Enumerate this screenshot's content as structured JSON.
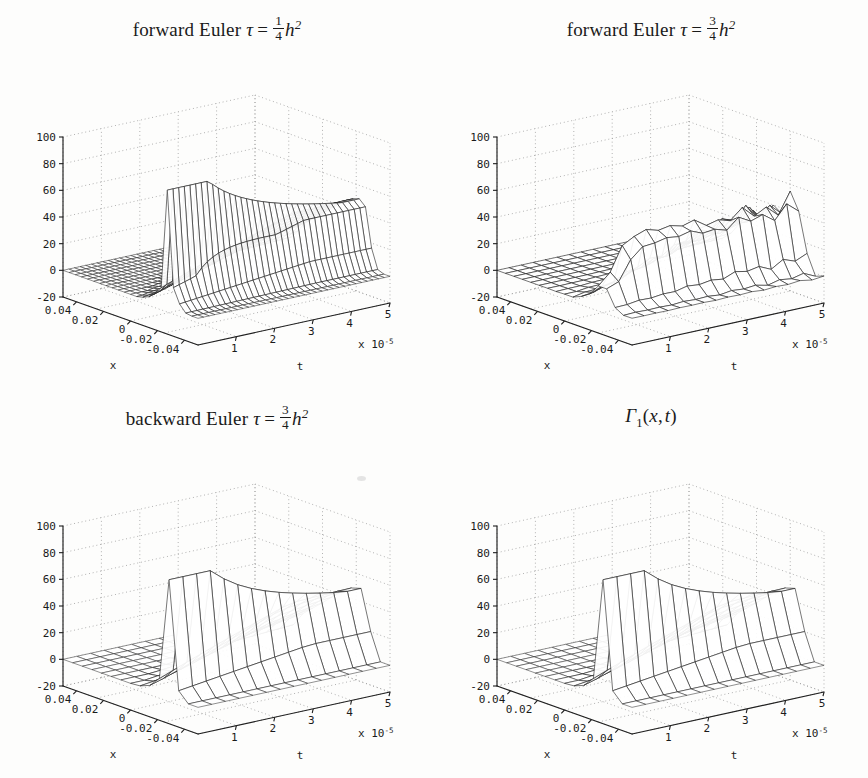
{
  "figure": {
    "background_color": "#fdfdfc",
    "ink_color": "#1a1a1a",
    "grid_color": "#9b9b9b",
    "layout": "2x2",
    "width": 868,
    "height": 778
  },
  "panels": [
    {
      "id": "forward-euler-quarter",
      "title_text": "forward Euler τ = 1/4 h²",
      "title_parts": {
        "scheme": "forward Euler",
        "tau": "τ",
        "equals": "=",
        "frac_num": "1",
        "frac_den": "4",
        "base": "h",
        "exponent": "2"
      },
      "behaviour": "stable smooth decaying pulse, fine mesh"
    },
    {
      "id": "forward-euler-three-quarter",
      "title_text": "forward Euler τ = 3/4 h²",
      "title_parts": {
        "scheme": "forward Euler",
        "tau": "τ",
        "equals": "=",
        "frac_num": "3",
        "frac_den": "4",
        "base": "h",
        "exponent": "2"
      },
      "behaviour": "unstable, growing sawtooth oscillations in t"
    },
    {
      "id": "backward-euler-three-quarter",
      "title_text": "backward Euler τ = 3/4 h²",
      "title_parts": {
        "scheme": "backward Euler",
        "tau": "τ",
        "equals": "=",
        "frac_num": "3",
        "frac_den": "4",
        "base": "h",
        "exponent": "2"
      },
      "behaviour": "stable smooth decaying pulse, coarse mesh"
    },
    {
      "id": "exact-kernel",
      "title_text": "Γ1(x,t)",
      "title_parts": {
        "symbol": "Γ",
        "subscript": "1",
        "args": "(x, t)"
      },
      "behaviour": "exact heat kernel reference surface, coarse mesh"
    }
  ],
  "axes": {
    "z": {
      "label": "",
      "ticks": [
        100,
        80,
        60,
        40,
        20,
        0,
        -20
      ],
      "tick_labels": [
        "100",
        "80",
        "60",
        "40",
        "20",
        "0",
        "-20"
      ],
      "limits": [
        -20,
        100
      ]
    },
    "x": {
      "label": "x",
      "ticks": [
        0.04,
        0.02,
        0,
        -0.02,
        -0.04
      ],
      "tick_labels": [
        "0.04",
        "0.02",
        "0",
        "-0.02",
        "-0.04"
      ],
      "limits": [
        -0.05,
        0.05
      ]
    },
    "t": {
      "label": "t",
      "ticks": [
        1,
        2,
        3,
        4,
        5
      ],
      "tick_labels": [
        "1",
        "2",
        "3",
        "4",
        "5"
      ],
      "limits": [
        0,
        5
      ],
      "multiplier_text": "x 10",
      "multiplier_exponent": "-5"
    }
  },
  "chart_data": {
    "type": "surface",
    "xlabel": "x",
    "ylabel": "t",
    "zlabel": "u",
    "xlim": [
      -0.05,
      0.05
    ],
    "ylim": [
      0,
      5e-05
    ],
    "zlim": [
      -20,
      100
    ],
    "xticks": [
      0.04,
      0.02,
      0,
      -0.02,
      -0.04
    ],
    "yticks": [
      1e-05,
      2e-05,
      3e-05,
      4e-05,
      5e-05
    ],
    "zticks": [
      -20,
      0,
      20,
      40,
      60,
      80,
      100
    ],
    "grid": true,
    "legend": "none",
    "view": "azimuth -37.5, elevation 30 (MATLAB default)",
    "peak_value": 88,
    "plateau_value": 50,
    "surfaces": [
      {
        "name": "forward Euler tau = h^2/4",
        "stable": true,
        "mesh_t_lines": 34,
        "mesh_x_lines": 22,
        "peak_z": 88,
        "plateau_z": 50,
        "note": "monotone decay in x, no oscillation in t"
      },
      {
        "name": "forward Euler tau = 3h^2/4",
        "stable": false,
        "mesh_t_lines": 16,
        "mesh_x_lines": 16,
        "peak_z": 88,
        "plateau_z": 45,
        "oscillation_amplitudes": [
          3,
          5,
          8,
          12,
          18,
          26,
          38,
          55,
          78
        ],
        "note": "spurious spikes grow with t, amplitude up to ~80"
      },
      {
        "name": "backward Euler tau = 3h^2/4",
        "stable": true,
        "mesh_t_lines": 14,
        "mesh_x_lines": 14,
        "peak_z": 88,
        "plateau_z": 50,
        "note": "unconditionally stable, smooth"
      },
      {
        "name": "Gamma_1(x,t) exact",
        "stable": true,
        "mesh_t_lines": 14,
        "mesh_x_lines": 14,
        "peak_z": 88,
        "plateau_z": 50,
        "note": "analytic reference, visually identical to backward Euler"
      }
    ]
  }
}
